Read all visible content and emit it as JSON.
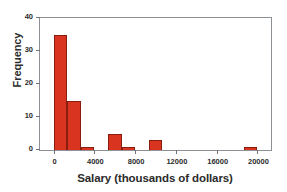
{
  "chart_data": {
    "type": "bar",
    "title": "",
    "xlabel": "Salary (thousands of dollars)",
    "ylabel": "Frequency",
    "xlim": [
      -1333,
      21333
    ],
    "ylim": [
      0,
      40
    ],
    "xticks": [
      0,
      4000,
      8000,
      12000,
      16000,
      20000
    ],
    "xtick_labels": [
      "0",
      "4000",
      "8000",
      "12000",
      "16000",
      "20000"
    ],
    "yticks": [
      0,
      10,
      20,
      30,
      40
    ],
    "ytick_labels": [
      "0",
      "10",
      "20",
      "30",
      "40"
    ],
    "grid": false,
    "legend": false,
    "bin_width": 1333,
    "bin_edges": [
      0,
      1333,
      2667,
      4000,
      5333,
      6667,
      8000,
      9333,
      10667,
      18667,
      20000
    ],
    "bins": [
      {
        "left": 0,
        "right": 1333,
        "value": 35
      },
      {
        "left": 1333,
        "right": 2667,
        "value": 15
      },
      {
        "left": 2667,
        "right": 4000,
        "value": 1
      },
      {
        "left": 5333,
        "right": 6667,
        "value": 5
      },
      {
        "left": 6667,
        "right": 8000,
        "value": 1
      },
      {
        "left": 9333,
        "right": 10667,
        "value": 3
      },
      {
        "left": 18667,
        "right": 20000,
        "value": 1
      }
    ],
    "colors": {
      "bar_fill": "#d8341f",
      "bar_edge": "#8a1d10",
      "frame": "#8d9095",
      "text": "#2b2b2b",
      "background": "#ffffff"
    }
  }
}
